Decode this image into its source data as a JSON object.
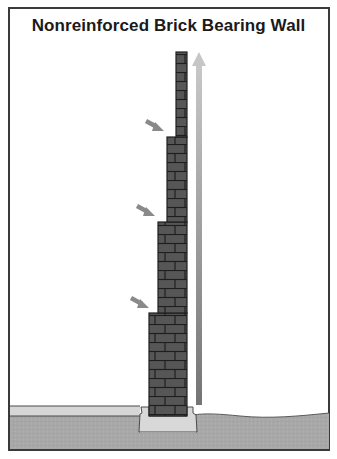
{
  "title": "Nonreinforced Brick Bearing Wall",
  "colors": {
    "frame": "#3a3a3a",
    "brick": "#555555",
    "mortar": "#1e1e1e",
    "arrow_side": "#8a8a8a",
    "arrow_up_top": "#c4c4c4",
    "arrow_up_bottom": "#777777",
    "slab": "#d6d6d6",
    "earth": "#a9a9a9",
    "footing": "#d8d8d8"
  },
  "diagram": {
    "wall_tiers": [
      {
        "label": "top tier",
        "left": 176,
        "right": 187,
        "top": 52,
        "bottom": 137
      },
      {
        "label": "second tier",
        "left": 167,
        "right": 187,
        "top": 137,
        "bottom": 222
      },
      {
        "label": "third tier",
        "left": 158,
        "right": 187,
        "top": 222,
        "bottom": 313
      },
      {
        "label": "bottom tier",
        "left": 149,
        "right": 187,
        "top": 313,
        "bottom": 416
      }
    ],
    "side_arrows": [
      {
        "name": "load-arrow-upper",
        "x1": 146,
        "y1": 121,
        "x2": 163,
        "y2": 131
      },
      {
        "name": "load-arrow-middle",
        "x1": 137,
        "y1": 206,
        "x2": 154,
        "y2": 216
      },
      {
        "name": "load-arrow-lower",
        "x1": 131,
        "y1": 297,
        "x2": 148,
        "y2": 307
      }
    ],
    "vertical_arrow": {
      "x": 199,
      "top": 52,
      "bottom": 405
    }
  }
}
